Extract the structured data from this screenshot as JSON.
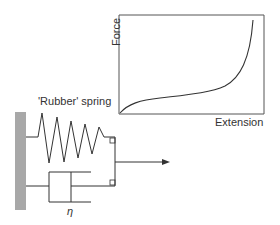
{
  "diagram": {
    "spring_label": "'Rubber' spring",
    "dashpot_label": "η",
    "graph": {
      "y_label": "Force",
      "x_label": "Extension"
    }
  },
  "colors": {
    "line": "#333333",
    "wall": "#a8a8a8"
  }
}
